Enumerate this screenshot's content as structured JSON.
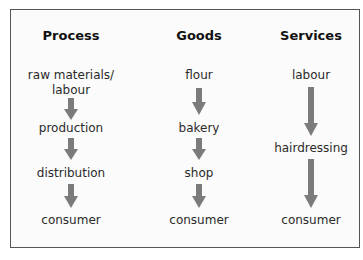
{
  "columns": [
    {
      "header": "Process",
      "steps": [
        "raw materials/",
        "labour",
        "production",
        "distribution",
        "consumer"
      ]
    },
    {
      "header": "Goods",
      "steps": [
        "flour",
        "bakery",
        "shop",
        "consumer"
      ]
    },
    {
      "header": "Services",
      "steps": [
        "labour",
        "hairdressing",
        "consumer"
      ]
    }
  ],
  "colors": {
    "arrow": "#7b7b7b",
    "border": "#555555"
  },
  "icons": {
    "arrow": "down-arrow-icon"
  }
}
